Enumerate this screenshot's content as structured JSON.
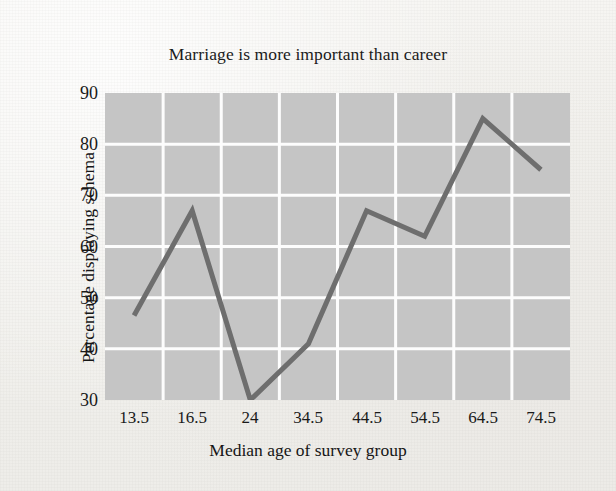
{
  "chart_data": {
    "type": "line",
    "title": "Marriage is more important than career",
    "xlabel": "Median age of survey group",
    "ylabel": "Percentage displaying schema",
    "categories": [
      "13.5",
      "16.5",
      "24",
      "34.5",
      "44.5",
      "54.5",
      "64.5",
      "74.5"
    ],
    "values": [
      46.5,
      67,
      30,
      41,
      67,
      62,
      85,
      75
    ],
    "series": [
      {
        "name": "Percentage displaying schema",
        "values": [
          46.5,
          67,
          30,
          41,
          67,
          62,
          85,
          75
        ]
      }
    ],
    "ylim": [
      30,
      90
    ],
    "yticks": [
      "30",
      "40",
      "50",
      "60",
      "70",
      "80",
      "90"
    ],
    "ytick_values": [
      30,
      40,
      50,
      60,
      70,
      80,
      90
    ],
    "xlim": [
      0,
      8
    ],
    "grid": true,
    "legend": "none",
    "colors": {
      "line": "#6e6e6e",
      "plot_background": "#c5c5c5",
      "gridline": "#fdfdfd",
      "page_background": "#f3f2ef",
      "text": "#191919"
    },
    "line_width": 5
  },
  "figure": {
    "title": "Marriage is more important than career",
    "x_axis_label": "Median age of survey group",
    "y_axis_label": "Percentage displaying schema"
  }
}
